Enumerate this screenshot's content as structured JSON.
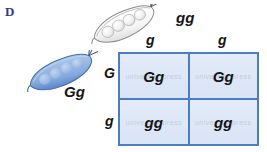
{
  "diagram": {
    "panel_letter": "D",
    "type": "punnett-square",
    "cross_description": "Gg x gg monohybrid cross"
  },
  "parents": {
    "top": {
      "genotype": "gg",
      "pod_color": "white",
      "icon": "pea-pod-icon"
    },
    "left": {
      "genotype": "Gg",
      "pod_color": "blue",
      "icon": "pea-pod-icon"
    }
  },
  "gametes": {
    "columns": [
      "g",
      "g"
    ],
    "rows": [
      "G",
      "g"
    ]
  },
  "punnett": {
    "rows": [
      {
        "cells": [
          "Gg",
          "Gg"
        ]
      },
      {
        "cells": [
          "gg",
          "gg"
        ]
      }
    ]
  },
  "watermark": {
    "text": "university press"
  },
  "colors": {
    "panel_letter": "#2b3a8f",
    "grid_border": "#4a7dc4",
    "cell_fill": "#dfe8f6",
    "pod_blue": "#7ca3da",
    "pod_white": "#fbfbfb",
    "text": "#141414"
  }
}
